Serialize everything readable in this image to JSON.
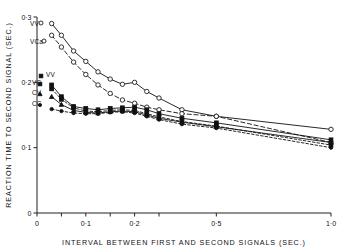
{
  "figure": {
    "ylabel": "REACTION TIME TO SECOND SIGNAL  (SEC.)",
    "xlabel": "INTERVAL BETWEEN FIRST AND SECOND SIGNALS (SEC.)"
  },
  "ticks": {
    "y": [
      "0·3",
      "0·2",
      "0·1",
      "0"
    ],
    "x": [
      "0",
      "0·1",
      "0·2",
      "0·5",
      "1·0"
    ]
  },
  "series_labels": {
    "vva": "VV",
    "vca": "VCa",
    "vv": "VV",
    "vc": "VC",
    "cv": "CV",
    "cc": "CC"
  },
  "chart_data": {
    "type": "line",
    "title": "",
    "xlabel": "INTERVAL BETWEEN FIRST AND SECOND SIGNALS (SEC.)",
    "ylabel": "REACTION TIME TO SECOND SIGNAL  (SEC.)",
    "xlim": [
      0,
      1.0
    ],
    "ylim": [
      0,
      0.3
    ],
    "xticks": [
      0,
      0.05,
      0.1,
      0.15,
      0.2,
      0.25,
      0.5,
      1.0
    ],
    "xticklabels": [
      "0",
      "",
      "0·1",
      "",
      "0·2",
      "",
      "0·5",
      "1·0"
    ],
    "yticks": [
      0,
      0.1,
      0.2,
      0.3
    ],
    "yticklabels": [
      "0",
      "0·1",
      "0·2",
      "0·3"
    ],
    "grid": false,
    "legend": "inline-left-labels",
    "axis_note": "x-axis compressed beyond 0.25",
    "series": [
      {
        "name": "VVa",
        "marker": "open-circle",
        "line": "solid",
        "x": [
          0.03,
          0.05,
          0.075,
          0.1,
          0.125,
          0.15,
          0.175,
          0.2,
          0.225,
          0.25,
          0.35,
          0.5,
          1.0
        ],
        "values": [
          0.29,
          0.272,
          0.248,
          0.232,
          0.216,
          0.205,
          0.197,
          0.2,
          0.186,
          0.176,
          0.158,
          0.148,
          0.128
        ]
      },
      {
        "name": "VCa",
        "marker": "open-circle",
        "line": "dashed",
        "x": [
          0.03,
          0.05,
          0.075,
          0.1,
          0.125,
          0.15,
          0.175,
          0.2,
          0.225,
          0.25,
          0.35,
          0.5,
          1.0
        ],
        "values": [
          0.272,
          0.254,
          0.231,
          0.212,
          0.196,
          0.183,
          0.173,
          0.168,
          0.162,
          0.158,
          0.152,
          0.148,
          0.108
        ]
      },
      {
        "name": "VV",
        "marker": "filled-square",
        "line": "solid",
        "x": [
          0.03,
          0.05,
          0.075,
          0.1,
          0.125,
          0.15,
          0.175,
          0.2,
          0.225,
          0.25,
          0.35,
          0.5,
          1.0
        ],
        "values": [
          0.196,
          0.178,
          0.163,
          0.16,
          0.158,
          0.16,
          0.161,
          0.162,
          0.158,
          0.152,
          0.145,
          0.138,
          0.112
        ]
      },
      {
        "name": "VC",
        "marker": "filled-square",
        "line": "dashed",
        "x": [
          0.03,
          0.05,
          0.075,
          0.1,
          0.125,
          0.15,
          0.175,
          0.2,
          0.225,
          0.25,
          0.35,
          0.5,
          1.0
        ],
        "values": [
          0.19,
          0.174,
          0.161,
          0.156,
          0.155,
          0.157,
          0.158,
          0.157,
          0.152,
          0.147,
          0.14,
          0.133,
          0.104
        ]
      },
      {
        "name": "CV",
        "marker": "filled-triangle",
        "line": "solid",
        "x": [
          0.03,
          0.05,
          0.075,
          0.1,
          0.125,
          0.15,
          0.175,
          0.2,
          0.225,
          0.25,
          0.35,
          0.5,
          1.0
        ],
        "values": [
          0.178,
          0.166,
          0.157,
          0.154,
          0.153,
          0.155,
          0.156,
          0.155,
          0.15,
          0.145,
          0.139,
          0.132,
          0.108
        ]
      },
      {
        "name": "CC",
        "marker": "filled-circle",
        "line": "dashed",
        "x": [
          0.03,
          0.05,
          0.075,
          0.1,
          0.125,
          0.15,
          0.175,
          0.2,
          0.225,
          0.25,
          0.35,
          0.5,
          1.0
        ],
        "values": [
          0.159,
          0.156,
          0.153,
          0.152,
          0.152,
          0.154,
          0.155,
          0.153,
          0.148,
          0.143,
          0.136,
          0.13,
          0.1
        ]
      }
    ]
  }
}
